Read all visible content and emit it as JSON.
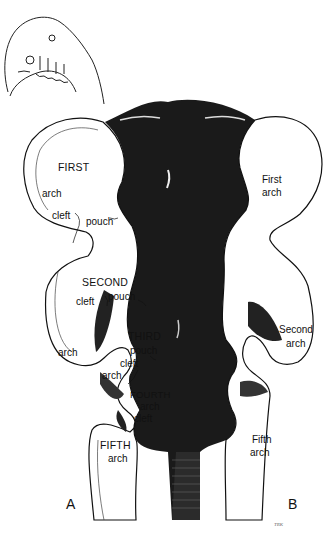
{
  "figure": {
    "inset": {
      "label": "embryo-head-side-view-inset"
    },
    "panel_a": {
      "letter": "A",
      "labels": {
        "first_arch_title": "FIRST",
        "first_arch_word": "arch",
        "first_cleft": "cleft",
        "first_pouch": "pouch",
        "second_title": "SECOND",
        "second_cleft": "cleft",
        "second_pouch": "pouch",
        "second_arch": "arch",
        "third_title": "THIRD",
        "third_pouch": "pouch",
        "third_cleft": "cleft",
        "third_arch": "arch",
        "fourth_title": "FOURTH",
        "fourth_arch": "arch",
        "fourth_cleft": "cleft",
        "fifth_title": "FIFTH",
        "fifth_arch": "arch"
      }
    },
    "panel_b": {
      "letter": "B",
      "labels": {
        "first_arch_l1": "First",
        "first_arch_l2": "arch",
        "second_arch_l1": "Second",
        "second_arch_l2": "arch",
        "fifth_arch_l1": "Fifth",
        "fifth_arch_l2": "arch"
      }
    },
    "signature": "TRK",
    "colors": {
      "ink": "#111111",
      "pharynx": "#1a1a1a",
      "background": "#ffffff"
    }
  }
}
